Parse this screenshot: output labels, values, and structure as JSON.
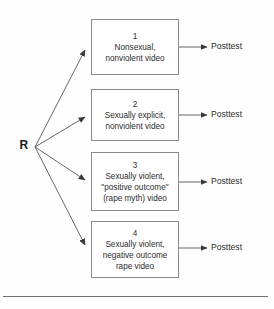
{
  "diagram": {
    "type": "experimental-design-flow",
    "randomization": {
      "label": "R",
      "meaning": "random-assignment-node"
    },
    "groups": [
      {
        "number": "1",
        "lines": [
          "Nonsexual,",
          "nonviolent video"
        ],
        "outcome": "Posttest",
        "box": {
          "x": 91,
          "y": 19,
          "w": 88,
          "h": 56
        },
        "arrow_tip": {
          "x": 88,
          "y": 47
        },
        "outcome_y": 47
      },
      {
        "number": "2",
        "lines": [
          "Sexually explicit,",
          "nonviolent video"
        ],
        "outcome": "Posttest",
        "box": {
          "x": 91,
          "y": 89,
          "w": 88,
          "h": 52
        },
        "arrow_tip": {
          "x": 88,
          "y": 115
        },
        "outcome_y": 115
      },
      {
        "number": "3",
        "lines": [
          "Sexually violent,",
          "\"positive outcome\"",
          "(rape myth) video"
        ],
        "outcome": "Posttest",
        "box": {
          "x": 91,
          "y": 152,
          "w": 88,
          "h": 59
        },
        "arrow_tip": {
          "x": 88,
          "y": 182
        },
        "outcome_y": 182
      },
      {
        "number": "4",
        "lines": [
          "Sexually violent,",
          "negative outcome",
          "rape video"
        ],
        "outcome": "Posttest",
        "box": {
          "x": 91,
          "y": 221,
          "w": 88,
          "h": 57
        },
        "arrow_tip": {
          "x": 88,
          "y": 248
        },
        "outcome_y": 248
      }
    ],
    "fan_origin": {
      "x": 35,
      "y": 147
    },
    "colors": {
      "box_border": "#8a8a8a",
      "line": "#555555",
      "text": "#2b2b2b",
      "rule": "#6f6f6f",
      "background": "#fefefe"
    },
    "footer_rule": {
      "x": 3,
      "y": 296,
      "w": 265
    }
  }
}
